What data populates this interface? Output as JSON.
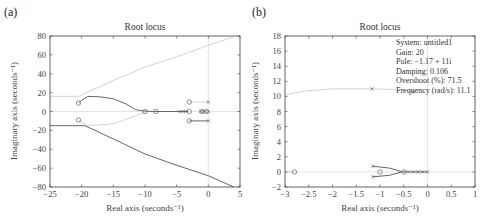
{
  "figure": {
    "panels": [
      {
        "label": "(a)"
      },
      {
        "label": "(b)"
      }
    ]
  },
  "chart_data": [
    {
      "type": "line",
      "panel": "(a)",
      "title": "Root locus",
      "xlabel": "Real axis (seconds⁻¹)",
      "ylabel": "Imaginary axis (seconds⁻¹)",
      "xlim": [
        -25,
        5
      ],
      "ylim": [
        -80,
        80
      ],
      "xticks": [
        -25,
        -20,
        -15,
        -10,
        -5,
        0,
        5
      ],
      "yticks": [
        -80,
        -60,
        -40,
        -20,
        0,
        20,
        40,
        60,
        80
      ],
      "xtick_labels": [
        "−25",
        "−20",
        "−15",
        "−10",
        "−5",
        "0",
        "5"
      ],
      "ytick_labels": [
        "−80",
        "−60",
        "−40",
        "−20",
        "0",
        "20",
        "40",
        "60",
        "80"
      ],
      "grid": false,
      "series": [
        {
          "name": "branch-upper-dark",
          "style": "dark",
          "points": [
            [
              -20.5,
              9
            ],
            [
              -20,
              12
            ],
            [
              -19,
              16
            ],
            [
              -17,
              15.5
            ],
            [
              -15,
              13.5
            ],
            [
              -13,
              8
            ],
            [
              -11.5,
              2
            ],
            [
              -10,
              0.3
            ],
            [
              -8.5,
              0
            ]
          ]
        },
        {
          "name": "branch-lower-dark",
          "style": "dark",
          "points": [
            [
              -25,
              -15
            ],
            [
              -19.5,
              -15
            ],
            [
              -15,
              -29
            ],
            [
              -10,
              -45
            ],
            [
              -5,
              -57
            ],
            [
              0,
              -68
            ],
            [
              4,
              -80
            ]
          ]
        },
        {
          "name": "branch-upper-light",
          "style": "light",
          "points": [
            [
              -25,
              16
            ],
            [
              -20.5,
              16
            ],
            [
              -15,
              33
            ],
            [
              -10,
              47
            ],
            [
              -5,
              58
            ],
            [
              0,
              70
            ],
            [
              4,
              79
            ]
          ]
        },
        {
          "name": "branch-lower-light",
          "style": "light",
          "points": [
            [
              -20.5,
              -9
            ],
            [
              -19,
              -15
            ],
            [
              -15,
              -13
            ],
            [
              -12,
              -6
            ],
            [
              -10,
              -0.5
            ]
          ]
        },
        {
          "name": "real-axis-dark",
          "style": "dark",
          "points": [
            [
              -8.5,
              0
            ],
            [
              -3.2,
              0
            ]
          ]
        },
        {
          "name": "pole-pair-upper",
          "style": "light",
          "points": [
            [
              -3,
              10
            ],
            [
              0,
              10
            ]
          ]
        },
        {
          "name": "pole-pair-lower",
          "style": "dark",
          "points": [
            [
              -3,
              -10
            ],
            [
              0,
              -10
            ]
          ]
        }
      ],
      "zeros": [
        [
          -20.5,
          9
        ],
        [
          -20.5,
          -9
        ],
        [
          -10,
          0
        ],
        [
          -8.3,
          0
        ],
        [
          -3,
          10
        ],
        [
          -3,
          -10
        ],
        [
          -3,
          0
        ],
        [
          -1,
          0
        ],
        [
          -0.3,
          0
        ]
      ],
      "poles": [
        [
          -4.5,
          0
        ],
        [
          -4,
          0
        ],
        [
          -3.6,
          0
        ],
        [
          -1.2,
          0
        ],
        [
          -0.8,
          0
        ],
        [
          -0.5,
          0
        ],
        [
          0,
          0
        ],
        [
          0,
          10
        ],
        [
          0,
          -10
        ]
      ]
    },
    {
      "type": "line",
      "panel": "(b)",
      "title": "Root locus",
      "xlabel": "Real axis (seconds⁻¹)",
      "ylabel": "Imaginary axis (seconds⁻¹)",
      "xlim": [
        -3,
        1
      ],
      "ylim": [
        -2,
        18
      ],
      "xticks": [
        -3,
        -2.5,
        -2,
        -1.5,
        -1,
        -0.5,
        0,
        0.5,
        1
      ],
      "yticks": [
        -2,
        0,
        2,
        4,
        6,
        8,
        10,
        12,
        14,
        16,
        18
      ],
      "xtick_labels": [
        "−3",
        "−2.5",
        "−2",
        "−1.5",
        "−1",
        "−0.5",
        "0",
        "0.5",
        "1"
      ],
      "ytick_labels": [
        "−2",
        "0",
        "2",
        "4",
        "6",
        "8",
        "10",
        "12",
        "14",
        "16",
        "18"
      ],
      "grid": false,
      "series": [
        {
          "name": "upper-arc-light",
          "style": "light",
          "points": [
            [
              -3,
              10.2
            ],
            [
              -2.6,
              10.7
            ],
            [
              -2.0,
              11.0
            ],
            [
              -1.17,
              11.0
            ],
            [
              -0.6,
              10.9
            ],
            [
              -0.3,
              10.6
            ]
          ]
        },
        {
          "name": "real-axis-light",
          "style": "light",
          "points": [
            [
              -3,
              0
            ],
            [
              -2.8,
              0
            ]
          ]
        },
        {
          "name": "loop-upper",
          "style": "dark",
          "points": [
            [
              -1.15,
              0.75
            ],
            [
              -0.8,
              0.5
            ],
            [
              -0.6,
              0.15
            ],
            [
              -0.55,
              0
            ]
          ]
        },
        {
          "name": "loop-lower",
          "style": "dark",
          "points": [
            [
              -1.15,
              -0.65
            ],
            [
              -0.8,
              -0.45
            ],
            [
              -0.6,
              -0.1
            ],
            [
              -0.55,
              0
            ]
          ]
        },
        {
          "name": "real-axis-dark",
          "style": "dark",
          "points": [
            [
              -0.55,
              0
            ],
            [
              0,
              0
            ]
          ]
        }
      ],
      "zeros": [
        [
          -2.8,
          0
        ],
        [
          -1.0,
          0
        ],
        [
          -0.5,
          0
        ]
      ],
      "poles": [
        [
          -1.17,
          11.0
        ],
        [
          -0.3,
          10.6
        ],
        [
          -1.15,
          0.75
        ],
        [
          -1.15,
          -0.65
        ],
        [
          -0.4,
          0
        ],
        [
          -0.3,
          0
        ],
        [
          -0.2,
          0
        ],
        [
          -0.1,
          0
        ],
        [
          0,
          0
        ]
      ],
      "annotation": {
        "lines": [
          "System: untitled1",
          "Gain: 20",
          "Pole: −1.17 + 11i",
          "Damping: 0.106",
          "Overshoot (%): 71.5",
          "Frequency (rad/s): 11.1"
        ],
        "system": "untitled1",
        "gain": 20,
        "pole": "-1.17 + 11i",
        "damping": 0.106,
        "overshoot_pct": 71.5,
        "frequency_rad_s": 11.1
      }
    }
  ]
}
